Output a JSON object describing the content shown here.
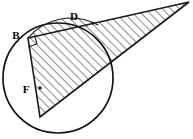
{
  "figure": {
    "background_color": "#ffffff",
    "stroke_color": "#1a1a1a",
    "hatch_color": "#222222",
    "labels": [
      {
        "id": "B",
        "text": "B",
        "x": 16,
        "y": 36
      },
      {
        "id": "D",
        "text": "D",
        "x": 74,
        "y": 17
      },
      {
        "id": "F",
        "text": "F",
        "x": 26,
        "y": 90
      }
    ],
    "circle": {
      "cx": 58,
      "cy": 78,
      "r": 55
    },
    "points": {
      "B": {
        "x": 28,
        "y": 38
      },
      "D": {
        "x": 80,
        "y": 29
      },
      "F": {
        "x": 40,
        "y": 88
      },
      "apex": {
        "x": 189,
        "y": 2
      },
      "bottom": {
        "x": 40,
        "y": 117
      }
    },
    "right_angle_marker": {
      "at": "B",
      "size": 9
    },
    "hatching": {
      "angle_deg": 45,
      "spacing": 4.2,
      "stroke_width": 1.0
    },
    "shapes": {
      "main_triangle": "B -> apex -> bottom -> B",
      "lens_segment": "arc B..D above chord B..apex"
    }
  }
}
